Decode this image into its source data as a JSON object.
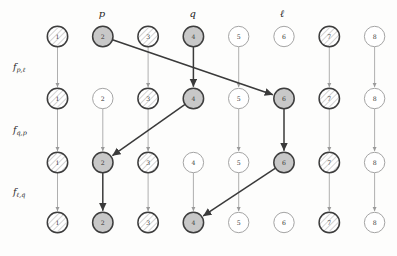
{
  "diagram": {
    "columns": 8,
    "rows": 4,
    "node_labels": [
      "1",
      "2",
      "3",
      "4",
      "5",
      "6",
      "7",
      "8"
    ],
    "column_markers": [
      {
        "label": "p",
        "column": 2
      },
      {
        "label": "q",
        "column": 4
      },
      {
        "label": "ℓ",
        "column": 6
      }
    ],
    "row_gap_labels": [
      {
        "base": "f",
        "sub": "p,ℓ"
      },
      {
        "base": "f",
        "sub": "q,p"
      },
      {
        "base": "f",
        "sub": "ℓ,q"
      }
    ],
    "styles": {
      "hatched": "#ffffff",
      "filled": "#c8c8c8",
      "empty": "#ffffff",
      "stroke_strong": "#3d3d3d",
      "stroke_light": "#9a9a9a",
      "arrow_strong": "#3a3a3a",
      "arrow_light": "#a0a0a0",
      "background": "#fdfdfc"
    },
    "rows_style": [
      [
        "hatched",
        "filled",
        "hatched",
        "filled",
        "empty",
        "empty",
        "hatched",
        "empty"
      ],
      [
        "hatched",
        "empty",
        "hatched",
        "filled",
        "empty",
        "filled",
        "hatched",
        "empty"
      ],
      [
        "hatched",
        "filled",
        "hatched",
        "empty",
        "empty",
        "filled",
        "hatched",
        "empty"
      ],
      [
        "hatched",
        "filled",
        "hatched",
        "filled",
        "empty",
        "empty",
        "hatched",
        "empty"
      ]
    ],
    "vertical_edges": [
      {
        "column": 1,
        "from_row": 1,
        "to_row": 2,
        "weight": "light"
      },
      {
        "column": 2,
        "from_row": 1,
        "to_row": 2,
        "weight": "none"
      },
      {
        "column": 3,
        "from_row": 1,
        "to_row": 2,
        "weight": "light"
      },
      {
        "column": 4,
        "from_row": 1,
        "to_row": 2,
        "weight": "strong"
      },
      {
        "column": 5,
        "from_row": 1,
        "to_row": 2,
        "weight": "light"
      },
      {
        "column": 6,
        "from_row": 1,
        "to_row": 2,
        "weight": "none"
      },
      {
        "column": 7,
        "from_row": 1,
        "to_row": 2,
        "weight": "light"
      },
      {
        "column": 8,
        "from_row": 1,
        "to_row": 2,
        "weight": "light"
      },
      {
        "column": 1,
        "from_row": 2,
        "to_row": 3,
        "weight": "light"
      },
      {
        "column": 2,
        "from_row": 2,
        "to_row": 3,
        "weight": "light"
      },
      {
        "column": 3,
        "from_row": 2,
        "to_row": 3,
        "weight": "light"
      },
      {
        "column": 4,
        "from_row": 2,
        "to_row": 3,
        "weight": "none"
      },
      {
        "column": 5,
        "from_row": 2,
        "to_row": 3,
        "weight": "light"
      },
      {
        "column": 6,
        "from_row": 2,
        "to_row": 3,
        "weight": "strong"
      },
      {
        "column": 7,
        "from_row": 2,
        "to_row": 3,
        "weight": "light"
      },
      {
        "column": 8,
        "from_row": 2,
        "to_row": 3,
        "weight": "light"
      },
      {
        "column": 1,
        "from_row": 3,
        "to_row": 4,
        "weight": "light"
      },
      {
        "column": 2,
        "from_row": 3,
        "to_row": 4,
        "weight": "strong"
      },
      {
        "column": 3,
        "from_row": 3,
        "to_row": 4,
        "weight": "light"
      },
      {
        "column": 4,
        "from_row": 3,
        "to_row": 4,
        "weight": "light"
      },
      {
        "column": 5,
        "from_row": 3,
        "to_row": 4,
        "weight": "light"
      },
      {
        "column": 6,
        "from_row": 3,
        "to_row": 4,
        "weight": "none"
      },
      {
        "column": 7,
        "from_row": 3,
        "to_row": 4,
        "weight": "light"
      },
      {
        "column": 8,
        "from_row": 3,
        "to_row": 4,
        "weight": "light"
      }
    ],
    "diagonal_edges": [
      {
        "from": {
          "column": 2,
          "row": 1
        },
        "to": {
          "column": 6,
          "row": 2
        },
        "weight": "strong"
      },
      {
        "from": {
          "column": 4,
          "row": 2
        },
        "to": {
          "column": 2,
          "row": 3
        },
        "weight": "strong"
      },
      {
        "from": {
          "column": 6,
          "row": 3
        },
        "to": {
          "column": 4,
          "row": 4
        },
        "weight": "strong"
      }
    ]
  }
}
